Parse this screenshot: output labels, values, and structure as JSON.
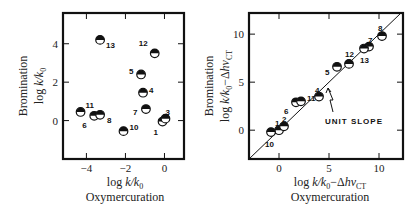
{
  "chart_data": [
    {
      "type": "scatter",
      "id": "left",
      "title": "",
      "xlabel": "log k/k0",
      "xlabel_line2": "Oxymercuration",
      "ylabel": "log k/k0",
      "ylabel_line1": "Bromination",
      "xlim": [
        -5.2,
        1.0
      ],
      "ylim": [
        -2.0,
        5.6
      ],
      "xticks": [
        -4,
        -2,
        0
      ],
      "xtick_labels": [
        "−4",
        "−2",
        "0"
      ],
      "yticks": [
        0,
        2,
        4
      ],
      "ytick_labels": [
        "0",
        "2",
        "4"
      ],
      "grid": false,
      "legend": null,
      "marker": "half-filled circle (top black, bottom white)",
      "points": [
        {
          "label": "1",
          "x": -0.1,
          "y": -0.05
        },
        {
          "label": "3",
          "x": 0.05,
          "y": 0.1
        },
        {
          "label": "4",
          "x": -1.1,
          "y": 1.45
        },
        {
          "label": "5",
          "x": -1.2,
          "y": 2.4
        },
        {
          "label": "6",
          "x": -3.6,
          "y": 0.25
        },
        {
          "label": "7",
          "x": -0.95,
          "y": 0.6
        },
        {
          "label": "8",
          "x": -3.3,
          "y": 0.3
        },
        {
          "label": "10",
          "x": -2.1,
          "y": -0.55
        },
        {
          "label": "11",
          "x": -4.3,
          "y": 0.45
        },
        {
          "label": "12",
          "x": -0.5,
          "y": 3.5
        },
        {
          "label": "13",
          "x": -3.3,
          "y": 4.2
        }
      ]
    },
    {
      "type": "scatter",
      "id": "right",
      "title": "",
      "xlabel": "log k/k0 − Δhν_CT",
      "xlabel_line2": "Oxymercuration",
      "ylabel": "log k/k0 − Δhν_CT",
      "ylabel_line1": "Bromination",
      "xlim": [
        -3.0,
        12.4
      ],
      "ylim": [
        -3.0,
        12.2
      ],
      "xticks": [
        0,
        5,
        10
      ],
      "xtick_labels": [
        "0",
        "5",
        "10"
      ],
      "yticks": [
        0,
        5,
        10
      ],
      "ytick_labels": [
        "0",
        "5",
        "10"
      ],
      "grid": false,
      "legend": null,
      "marker": "half-filled circle (top black, bottom white)",
      "reference_line": {
        "label": "UNIT SLOPE",
        "slope": 1,
        "intercept": 0
      },
      "points": [
        {
          "label": "1",
          "x": 0.0,
          "y": 0.0
        },
        {
          "label": "2",
          "x": 0.5,
          "y": 0.4
        },
        {
          "label": "4",
          "x": 4.0,
          "y": 3.5
        },
        {
          "label": "5",
          "x": 5.8,
          "y": 6.6
        },
        {
          "label": "6",
          "x": 1.7,
          "y": 2.9
        },
        {
          "label": "7",
          "x": 9.0,
          "y": 8.7
        },
        {
          "label": "8",
          "x": 10.3,
          "y": 9.8
        },
        {
          "label": "10",
          "x": -0.8,
          "y": -0.2
        },
        {
          "label": "11",
          "x": 2.2,
          "y": 3.0
        },
        {
          "label": "12",
          "x": 7.0,
          "y": 6.9
        },
        {
          "label": "13",
          "x": 8.5,
          "y": 8.5
        }
      ]
    }
  ],
  "left_plot": {
    "ylabel_line1": "Bromination",
    "ylabel_line2_pre": "log ",
    "ylabel_line2_it": "k/k",
    "ylabel_line2_sub": "0",
    "xlabel_pre": "log ",
    "xlabel_it": "k/k",
    "xlabel_sub": "0",
    "xlabel_line2": "Oxymercuration"
  },
  "right_plot": {
    "ylabel_line1": "Bromination",
    "ylabel_line2_pre": "log ",
    "ylabel_line2_it": "k/k",
    "ylabel_line2_sub": "0",
    "ylabel_line2_post": "−Δ",
    "ylabel_line2_it2": "hν",
    "ylabel_line2_sub2": "CT",
    "xlabel_pre": "log ",
    "xlabel_it": "k/k",
    "xlabel_sub": "0",
    "xlabel_post": "−Δ",
    "xlabel_it2": "hν",
    "xlabel_sub2": "CT",
    "xlabel_line2": "Oxymercuration",
    "annotation": "UNIT SLOPE"
  }
}
